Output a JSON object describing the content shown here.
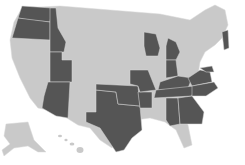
{
  "map": {
    "title": "",
    "colors": {
      "highlighted": "#555555",
      "other": "#c9c9c9",
      "background": "#ffffff"
    },
    "highlighted_states": [
      "WA",
      "OR",
      "ID",
      "UT",
      "AZ",
      "TX",
      "OK",
      "MO",
      "WI",
      "MI",
      "IN",
      "KY",
      "TN",
      "VA",
      "NC",
      "MD",
      "VT",
      "AL",
      "GA",
      "AR"
    ],
    "other_states": [
      "CA",
      "NV",
      "MT",
      "WY",
      "CO",
      "NM",
      "ND",
      "SD",
      "NE",
      "KS",
      "MN",
      "IA",
      "IL",
      "OH",
      "LA",
      "MS",
      "FL",
      "SC",
      "WV",
      "PA",
      "NY",
      "NJ",
      "DE",
      "CT",
      "RI",
      "MA",
      "NH",
      "ME",
      "AK",
      "HI"
    ]
  }
}
